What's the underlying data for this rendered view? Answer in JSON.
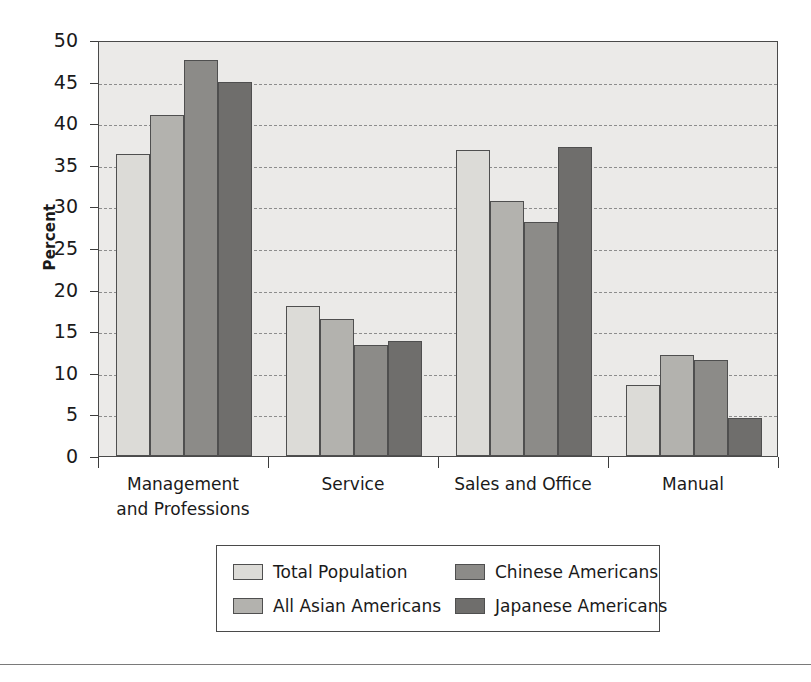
{
  "chart_data": {
    "type": "bar",
    "title": "",
    "subtitle": "",
    "xlabel": "",
    "ylabel": "Percent",
    "ylim": [
      0,
      50
    ],
    "yticks": [
      0,
      5,
      10,
      15,
      20,
      25,
      30,
      35,
      40,
      45,
      50
    ],
    "ytick_labels": [
      "0",
      "5",
      "10",
      "15",
      "20",
      "25",
      "30",
      "35",
      "40",
      "45",
      "50"
    ],
    "grid": true,
    "grid_style": "dashed-horizontal",
    "legend_position": "bottom-center",
    "categories": [
      "Management\nand Professions",
      "Service",
      "Sales and Office",
      "Manual"
    ],
    "series": [
      {
        "name": "Total Population",
        "color": "#dcdbd7",
        "values": [
          36.3,
          18.0,
          36.8,
          8.5
        ]
      },
      {
        "name": "All Asian Americans",
        "color": "#b3b2ae",
        "values": [
          41.0,
          16.5,
          30.7,
          12.1
        ]
      },
      {
        "name": "Chinese Americans",
        "color": "#8c8b88",
        "values": [
          47.6,
          13.3,
          28.1,
          11.5
        ]
      },
      {
        "name": "Japanese Americans",
        "color": "#6f6e6c",
        "values": [
          44.9,
          13.8,
          37.2,
          4.6
        ]
      }
    ]
  },
  "legend": {
    "entries": [
      {
        "label": "Total Population",
        "color": "#dcdbd7"
      },
      {
        "label": "Chinese Americans",
        "color": "#8c8b88"
      },
      {
        "label": "All Asian Americans",
        "color": "#b3b2ae"
      },
      {
        "label": "Japanese Americans",
        "color": "#6f6e6c"
      }
    ]
  },
  "colors": {
    "plot_background": "#ebeae8",
    "axis": "#4a4a4a",
    "gridline": "#8d8d8d",
    "text": "#1a1a1a"
  }
}
